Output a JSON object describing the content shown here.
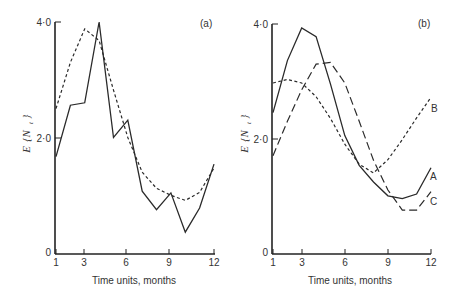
{
  "chart_data": [
    {
      "panel": "(a)",
      "type": "line",
      "title": "",
      "xlabel": "Time units, months",
      "ylabel": "E {N_t}",
      "xlim": [
        1,
        12
      ],
      "ylim": [
        0,
        4.0
      ],
      "x_ticks": [
        1,
        3,
        6,
        9,
        12
      ],
      "y_ticks": [
        "0",
        "2·0",
        "4·0"
      ],
      "grid": false,
      "x": [
        1,
        2,
        3,
        4,
        5,
        6,
        7,
        8,
        9,
        10,
        11,
        12
      ],
      "series": [
        {
          "name": "observed",
          "style": "solid",
          "values": [
            1.67,
            2.56,
            2.6,
            4.0,
            2.0,
            2.3,
            1.07,
            0.75,
            1.04,
            0.36,
            0.78,
            1.54
          ]
        },
        {
          "name": "fitted",
          "style": "short-dash",
          "values": [
            2.5,
            3.3,
            3.88,
            3.68,
            2.82,
            2.0,
            1.4,
            1.12,
            1.0,
            0.91,
            1.05,
            1.47
          ]
        }
      ]
    },
    {
      "panel": "(b)",
      "type": "line",
      "title": "",
      "xlabel": "Time units, months",
      "ylabel": "E {N_t}",
      "xlim": [
        1,
        12
      ],
      "ylim": [
        0,
        4.0
      ],
      "x_ticks": [
        1,
        3,
        6,
        9,
        12
      ],
      "y_ticks": [
        "0",
        "2·0",
        "4·0"
      ],
      "grid": false,
      "x": [
        1,
        2,
        3,
        4,
        5,
        6,
        7,
        8,
        9,
        10,
        11,
        12
      ],
      "series": [
        {
          "name": "A",
          "style": "solid",
          "values": [
            2.45,
            3.36,
            3.93,
            3.78,
            2.95,
            2.05,
            1.53,
            1.24,
            1.0,
            0.95,
            1.03,
            1.49
          ]
        },
        {
          "name": "B",
          "style": "short-dash",
          "values": [
            2.97,
            3.03,
            2.97,
            2.73,
            2.35,
            1.9,
            1.55,
            1.4,
            1.63,
            1.98,
            2.36,
            2.72
          ]
        },
        {
          "name": "C",
          "style": "long-dash",
          "values": [
            1.7,
            2.3,
            2.85,
            3.3,
            3.33,
            2.97,
            2.3,
            1.62,
            1.1,
            0.75,
            0.75,
            1.07
          ]
        }
      ]
    }
  ],
  "panels": {
    "a": {
      "label": "(a)"
    },
    "b": {
      "label": "(b)"
    }
  },
  "axes": {
    "xlabel": "Time units, months",
    "ylabel_E": "E",
    "ylabel_N": "{N",
    "ylabel_sub": "t",
    "ylabel_close": "}",
    "x_tick_labels": [
      "1",
      "3",
      "6",
      "9",
      "12"
    ],
    "y_tick_labels": [
      "0",
      "2·0",
      "4·0"
    ]
  },
  "legend": {
    "A": "A",
    "B": "B",
    "C": "C"
  }
}
